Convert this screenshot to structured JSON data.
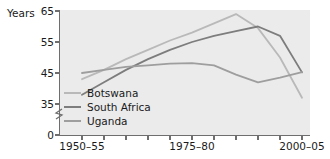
{
  "axis": {
    "y_title": "Years",
    "y_ticks": [
      "65",
      "55",
      "45",
      "35",
      "0"
    ],
    "x_ticks_labeled": [
      "1950–55",
      "1975–80",
      "2000–05"
    ],
    "break_marker": "axis-break-zigzag"
  },
  "legend": {
    "position": "inside-bottom-left",
    "entries": [
      {
        "label": "Botswana",
        "color": "#b9b9b9"
      },
      {
        "label": "South Africa",
        "color": "#7d7d7d"
      },
      {
        "label": "Uganda",
        "color": "#9e9e9e"
      }
    ]
  },
  "chart_data": {
    "type": "line",
    "title": "",
    "xlabel": "",
    "ylabel": "Years",
    "ylim": [
      33,
      65
    ],
    "xlim": [
      0,
      10
    ],
    "grid": false,
    "legend_position": "inside-bottom-left",
    "categories": [
      "1950–55",
      "1955–60",
      "1960–65",
      "1965–70",
      "1970–75",
      "1975–80",
      "1980–85",
      "1985–90",
      "1990–95",
      "1995–2000",
      "2000–05"
    ],
    "series": [
      {
        "name": "Botswana",
        "color": "#b9b9b9",
        "values": [
          43.0,
          46.0,
          49.5,
          52.5,
          55.5,
          58.0,
          61.0,
          64.0,
          59.5,
          50.0,
          37.0
        ]
      },
      {
        "name": "South Africa",
        "color": "#7d7d7d",
        "values": [
          38.0,
          42.0,
          46.0,
          49.5,
          52.5,
          55.0,
          57.0,
          58.5,
          60.0,
          57.0,
          45.2
        ]
      },
      {
        "name": "Uganda",
        "color": "#9e9e9e",
        "values": [
          45.0,
          46.0,
          47.0,
          47.5,
          48.0,
          48.2,
          47.5,
          44.5,
          42.0,
          43.5,
          45.3
        ]
      }
    ]
  }
}
